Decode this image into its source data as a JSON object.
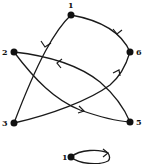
{
  "diagram": {
    "type": "directed-graph",
    "nodes": [
      {
        "id": "1",
        "label": "1"
      },
      {
        "id": "2",
        "label": "2"
      },
      {
        "id": "3",
        "label": "3"
      },
      {
        "id": "5",
        "label": "5"
      },
      {
        "id": "6",
        "label": "6"
      },
      {
        "id": "1b",
        "label": "1"
      }
    ],
    "edges": [
      {
        "from": "1",
        "to": "3"
      },
      {
        "from": "6",
        "to": "1"
      },
      {
        "from": "5",
        "to": "2"
      },
      {
        "from": "2",
        "to": "5"
      },
      {
        "from": "3",
        "to": "6"
      },
      {
        "from": "1b",
        "to": "1b",
        "type": "self-loop"
      }
    ],
    "colors": {
      "ink": "#111111",
      "background": "#ffffff"
    }
  }
}
